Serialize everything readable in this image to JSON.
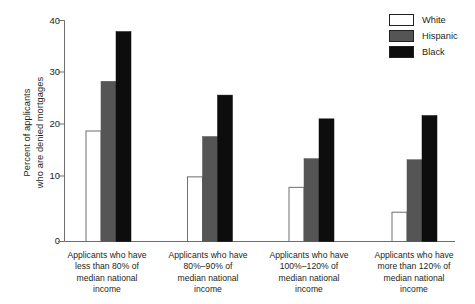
{
  "chart_data": {
    "type": "bar",
    "title": "",
    "xlabel": "",
    "ylabel": "Percent of applicants who are denied mortgages",
    "ylabel_line1": "Percent of applicants",
    "ylabel_line2": "who are denied mortgages",
    "ylim": [
      0,
      40
    ],
    "yticks": [
      0,
      10,
      20,
      30,
      40
    ],
    "ytick_labels": [
      "0",
      "10",
      "20",
      "30",
      "40"
    ],
    "grid": false,
    "legend_position": "top-right",
    "categories": [
      "Applicants who have less than 80% of median national income",
      "Applicants who have 80%–90% of median national income",
      "Applicants who have 100%–120% of median national income",
      "Applicants who have more than 120% of median national income"
    ],
    "category_lines": [
      [
        "Applicants who have",
        "less than 80% of",
        "median national",
        "income"
      ],
      [
        "Applicants who have",
        "80%–90% of",
        "median national",
        "income"
      ],
      [
        "Applicants who have",
        "100%–120% of",
        "median national",
        "income"
      ],
      [
        "Applicants who have",
        "more than 120% of",
        "median national",
        "income"
      ]
    ],
    "series": [
      {
        "name": "White",
        "color": "#ffffff",
        "values": [
          20.0,
          11.7,
          9.8,
          5.3
        ]
      },
      {
        "name": "Hispanic",
        "color": "#555555",
        "values": [
          29.0,
          19.0,
          15.0,
          14.8
        ]
      },
      {
        "name": "Black",
        "color": "#0d0d0d",
        "values": [
          38.0,
          26.5,
          22.2,
          22.8
        ]
      }
    ]
  },
  "legend": {
    "items": [
      {
        "label": "White"
      },
      {
        "label": "Hispanic"
      },
      {
        "label": "Black"
      }
    ]
  }
}
